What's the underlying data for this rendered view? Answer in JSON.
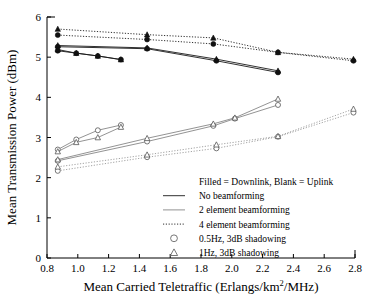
{
  "chart_data": {
    "type": "line",
    "title": "",
    "xlabel": "Mean Carried Teletraffic (Erlangs/km2/MHz)",
    "xlabel_main": "Mean Carried Teletraffic (Erlangs/km",
    "xlabel_sup": "2",
    "xlabel_tail": "/MHz)",
    "ylabel": "Mean Transmission Power (dBm)",
    "xlim": [
      0.8,
      2.8
    ],
    "ylim": [
      0,
      6
    ],
    "xticks": [
      0.8,
      1.0,
      1.2,
      1.4,
      1.6,
      1.8,
      2.0,
      2.2,
      2.4,
      2.6,
      2.8
    ],
    "xtick_labels": [
      "0.8",
      "1.0",
      "1.2",
      "1.4",
      "1.6",
      "1.8",
      "2.0",
      "2.2",
      "2.4",
      "2.6",
      "2.8"
    ],
    "yticks": [
      0,
      1,
      2,
      3,
      4,
      5,
      6
    ],
    "ytick_labels": [
      "0",
      "1",
      "2",
      "3",
      "4",
      "5",
      "6"
    ],
    "grid": false,
    "legend_position": "inside-lower-right",
    "series": [
      {
        "name": "Downlink, no beamforming, 0.5Hz 3dB shadowing",
        "link": "downlink",
        "marker": "circle",
        "fill": "filled",
        "line": "solid",
        "x": [
          0.87,
          0.99,
          1.13,
          1.28
        ],
        "y": [
          5.16,
          5.1,
          5.03,
          4.94
        ]
      },
      {
        "name": "Downlink, no beamforming, 1Hz 3dB shadowing",
        "link": "downlink",
        "marker": "triangle",
        "fill": "filled",
        "line": "solid",
        "x": [
          0.87,
          0.99,
          1.13,
          1.28
        ],
        "y": [
          5.19,
          5.1,
          5.03,
          4.94
        ]
      },
      {
        "name": "Downlink, 2 element beamforming, 0.5Hz 3dB shadowing",
        "link": "downlink",
        "marker": "circle",
        "fill": "filled",
        "line": "solid",
        "x": [
          0.87,
          1.45,
          1.9,
          2.3
        ],
        "y": [
          5.26,
          5.21,
          4.91,
          4.62
        ]
      },
      {
        "name": "Downlink, 2 element beamforming, 1Hz 3dB shadowing",
        "link": "downlink",
        "marker": "triangle",
        "fill": "filled",
        "line": "solid",
        "x": [
          0.87,
          1.45,
          1.9,
          2.3
        ],
        "y": [
          5.29,
          5.23,
          4.95,
          4.66
        ]
      },
      {
        "name": "Downlink, 4 element beamforming, 0.5Hz 3dB shadowing",
        "link": "downlink",
        "marker": "circle",
        "fill": "filled",
        "line": "dotted",
        "x": [
          0.87,
          1.45,
          1.88,
          2.3,
          2.79
        ],
        "y": [
          5.55,
          5.44,
          5.33,
          5.12,
          4.91
        ]
      },
      {
        "name": "Downlink, 4 element beamforming, 1Hz 3dB shadowing",
        "link": "downlink",
        "marker": "triangle",
        "fill": "filled",
        "line": "dotted",
        "x": [
          0.87,
          1.45,
          1.88,
          2.3,
          2.79
        ],
        "y": [
          5.7,
          5.56,
          5.48,
          5.12,
          4.95
        ]
      },
      {
        "name": "Uplink, no beamforming, 0.5Hz 3dB shadowing",
        "link": "uplink",
        "marker": "circle",
        "fill": "open",
        "line": "solid",
        "x": [
          0.87,
          0.99,
          1.13,
          1.28
        ],
        "y": [
          2.7,
          2.95,
          3.18,
          3.31
        ]
      },
      {
        "name": "Uplink, no beamforming, 1Hz 3dB shadowing",
        "link": "uplink",
        "marker": "triangle",
        "fill": "open",
        "line": "solid",
        "x": [
          0.87,
          0.99,
          1.13,
          1.28
        ],
        "y": [
          2.65,
          2.88,
          3.0,
          3.26
        ]
      },
      {
        "name": "Uplink, 2 element beamforming, 0.5Hz 3dB shadowing",
        "link": "uplink",
        "marker": "circle",
        "fill": "open",
        "line": "solid",
        "x": [
          0.87,
          1.45,
          1.88,
          2.02,
          2.3
        ],
        "y": [
          2.42,
          2.9,
          3.29,
          3.47,
          3.81
        ]
      },
      {
        "name": "Uplink, 2 element beamforming, 1Hz 3dB shadowing",
        "link": "uplink",
        "marker": "triangle",
        "fill": "open",
        "line": "solid",
        "x": [
          0.87,
          1.45,
          1.88,
          2.02,
          2.3
        ],
        "y": [
          2.45,
          2.98,
          3.34,
          3.49,
          3.96
        ]
      },
      {
        "name": "Uplink, 4 element beamforming, 0.5Hz 3dB shadowing",
        "link": "uplink",
        "marker": "circle",
        "fill": "open",
        "line": "dotted",
        "x": [
          0.87,
          1.45,
          1.9,
          2.3,
          2.79
        ],
        "y": [
          2.17,
          2.51,
          2.73,
          3.02,
          3.62
        ]
      },
      {
        "name": "Uplink, 4 element beamforming, 1Hz 3dB shadowing",
        "link": "uplink",
        "marker": "triangle",
        "fill": "open",
        "line": "dotted",
        "x": [
          0.87,
          1.45,
          1.9,
          2.3,
          2.79
        ],
        "y": [
          2.27,
          2.57,
          2.82,
          3.03,
          3.71
        ]
      }
    ],
    "legend": {
      "note": "Filled = Downlink, Blank = Uplink",
      "entries": [
        {
          "label": "No beamforming",
          "style": "solid",
          "symbol": "line"
        },
        {
          "label": "2 element beamforming",
          "style": "solid-grey",
          "symbol": "line"
        },
        {
          "label": "4 element beamforming",
          "style": "dotted",
          "symbol": "line"
        },
        {
          "label": "0.5Hz, 3dB shadowing",
          "style": "none",
          "symbol": "circle"
        },
        {
          "label": "1Hz, 3dB shadowing",
          "style": "none",
          "symbol": "triangle"
        }
      ]
    }
  }
}
